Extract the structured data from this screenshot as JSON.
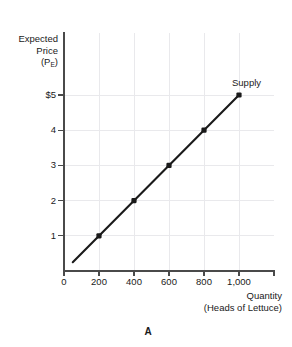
{
  "panel": {
    "caption": "A"
  },
  "chart_data": {
    "type": "line",
    "title": "",
    "subtitle": "",
    "xlabel": "Quantity",
    "xlabel_line2": "(Heads of Lettuce)",
    "ylabel": "Expected",
    "ylabel_line2": "Price",
    "ylabel_line3_prefix": "(P",
    "ylabel_line3_sub": "E",
    "ylabel_line3_suffix": ")",
    "x": [
      200,
      400,
      600,
      800,
      1000
    ],
    "values": [
      1,
      2,
      3,
      4,
      5
    ],
    "series": [
      {
        "name": "Supply",
        "x": [
          200,
          400,
          600,
          800,
          1000
        ],
        "values": [
          1,
          2,
          3,
          4,
          5
        ]
      }
    ],
    "xlim": [
      0,
      1200
    ],
    "ylim": [
      0,
      5.9
    ],
    "xticks": [
      0,
      200,
      400,
      600,
      800,
      1000
    ],
    "xticklabels": [
      "0",
      "200",
      "400",
      "600",
      "800",
      "1,000"
    ],
    "yticks": [
      1,
      2,
      3,
      4,
      5
    ],
    "yticklabels": [
      "1",
      "2",
      "3",
      "4",
      "$5"
    ],
    "grid": true,
    "legend": "none",
    "annotations": [
      {
        "text": "Supply",
        "x": 1000,
        "y": 5.35
      }
    ],
    "line_extent": {
      "x_start": 50,
      "y_start": 0.25,
      "x_end": 1000,
      "y_end": 5
    },
    "colors": {
      "line": "#1a1a1a",
      "marker": "#1a1a1a",
      "axis": "#4a4a4a",
      "grid": "#e9e9ec",
      "background": "#ffffff"
    }
  }
}
